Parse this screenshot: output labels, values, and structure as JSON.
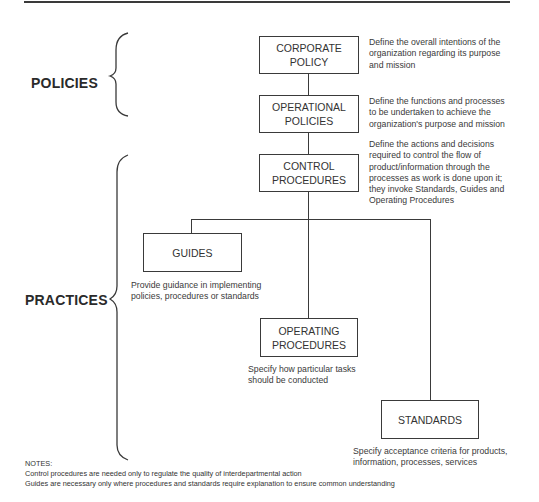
{
  "groups": {
    "policies": {
      "label": "POLICIES"
    },
    "practices": {
      "label": "PRACTICES"
    }
  },
  "boxes": {
    "corporate_policy": {
      "line1": "CORPORATE",
      "line2": "POLICY",
      "description": [
        "Define the overall intentions of the",
        "organization regarding its purpose",
        "and mission"
      ]
    },
    "operational_policies": {
      "line1": "OPERATIONAL",
      "line2": "POLICIES",
      "description": [
        "Define the functions and processes",
        "to be undertaken to achieve the",
        "organization's purpose and mission"
      ]
    },
    "control_procedures": {
      "line1": "CONTROL",
      "line2": "PROCEDURES",
      "description": [
        "Define the actions and decisions",
        "required to control the flow of",
        "product/information through the",
        "processes as work is done upon it;",
        "they invoke Standards, Guides and",
        "Operating Procedures"
      ]
    },
    "guides": {
      "line1": "GUIDES",
      "description": [
        "Provide guidance in implementing",
        "policies, procedures or standards"
      ]
    },
    "operating_procedures": {
      "line1": "OPERATING",
      "line2": "PROCEDURES",
      "description": [
        "Specify how particular tasks",
        "should be conducted"
      ]
    },
    "standards": {
      "line1": "STANDARDS",
      "description": [
        "Specify acceptance criteria for products,",
        "information, processes, services"
      ]
    }
  },
  "notes": {
    "heading": "NOTES:",
    "items": [
      "Control procedures are needed only to regulate the quality of interdepartmental action",
      "Guides are necessary only where procedures and standards require explanation to ensure common understanding"
    ]
  }
}
